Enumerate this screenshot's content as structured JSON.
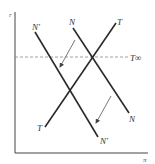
{
  "diagram": {
    "axes": {
      "y_label": "r",
      "x_label": "π"
    },
    "lines": [
      {
        "name": "N-prime",
        "label_top": "N'",
        "label_bottom": "N'"
      },
      {
        "name": "N",
        "label_top": "N",
        "label_bottom": "N"
      },
      {
        "name": "T",
        "label_top": "T",
        "label_bottom": "T"
      }
    ],
    "reference_line": {
      "label": "T∞",
      "style": "dashed"
    },
    "arrows": [
      {
        "description": "shift from N to N' (upper)"
      },
      {
        "description": "shift from N to N' (lower)"
      }
    ],
    "colors": {
      "line": "#2a2a2a",
      "dashed": "#888888",
      "arrow": "#555555"
    }
  }
}
